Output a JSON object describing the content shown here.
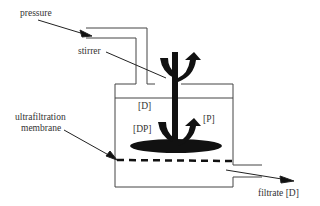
{
  "diagram": {
    "labels": {
      "pressure": "pressure",
      "stirrer": "stirrer",
      "membrane_line1": "ultrafiltration",
      "membrane_line2": "membrane",
      "d_conc": "[D]",
      "dp_conc": "[DP]",
      "p_conc": "[P]",
      "filtrate": "filtrate [D]"
    },
    "colors": {
      "line": "#333333",
      "fill": "#111111",
      "background": "#ffffff"
    }
  }
}
